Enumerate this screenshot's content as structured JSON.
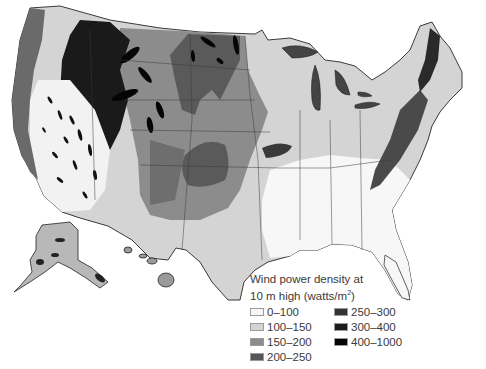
{
  "map": {
    "subject": "Contiguous United States, Alaska and Hawaii — wind power density",
    "regions_shown": [
      "Contiguous United States",
      "Alaska",
      "Hawaii"
    ]
  },
  "legend": {
    "title_line1": "Wind power density at",
    "title_line2_prefix": "10 m high (watts/m",
    "title_sup": "2",
    "title_line2_suffix": ")",
    "classes": [
      {
        "label": "0–100",
        "color": "#f7f7f7"
      },
      {
        "label": "100–150",
        "color": "#d4d4d4"
      },
      {
        "label": "150–200",
        "color": "#8c8c8c"
      },
      {
        "label": "200–250",
        "color": "#555555"
      },
      {
        "label": "250–300",
        "color": "#333333"
      },
      {
        "label": "300–400",
        "color": "#1c1c1c"
      },
      {
        "label": "400–1000",
        "color": "#050505"
      }
    ]
  },
  "colors": {
    "background": "#ffffff",
    "border_lines": "#3a3a3a",
    "text": "#3a3a3a"
  }
}
